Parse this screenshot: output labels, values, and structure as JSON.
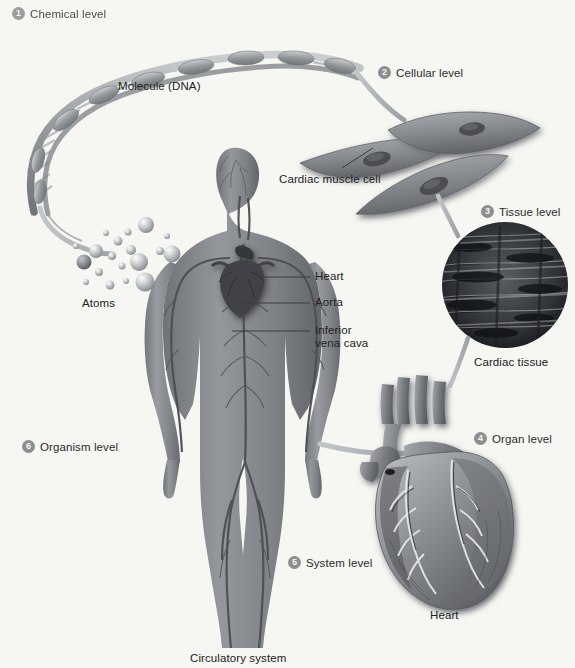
{
  "figure": {
    "background_color": "#f6f6f3",
    "badge_color": "#8e8e8e",
    "text_color": "#2b2b2b"
  },
  "levels": [
    {
      "number": "1",
      "label": "Chemical level",
      "x": 12,
      "y": 7
    },
    {
      "number": "2",
      "label": "Cellular level",
      "x": 378,
      "y": 66
    },
    {
      "number": "3",
      "label": "Tissue level",
      "x": 481,
      "y": 205
    },
    {
      "number": "4",
      "label": "Organ level",
      "x": 474,
      "y": 432
    },
    {
      "number": "5",
      "label": "System level",
      "x": 288,
      "y": 556
    },
    {
      "number": "6",
      "label": "Organism level",
      "x": 22,
      "y": 440
    }
  ],
  "captions": [
    {
      "name": "molecule-dna-caption",
      "text": "Molecule (DNA)",
      "x": 118,
      "y": 80
    },
    {
      "name": "atoms-caption",
      "text": "Atoms",
      "x": 82,
      "y": 297
    },
    {
      "name": "cardiac-muscle-cell-caption",
      "text": "Cardiac muscle cell",
      "x": 279,
      "y": 173
    },
    {
      "name": "cardiac-tissue-caption",
      "text": "Cardiac tissue",
      "x": 474,
      "y": 356
    },
    {
      "name": "heart-organ-caption",
      "text": "Heart",
      "x": 430,
      "y": 609
    },
    {
      "name": "circulatory-system-caption",
      "text": "Circulatory system",
      "x": 190,
      "y": 652
    }
  ],
  "body_labels": [
    {
      "name": "heart-label",
      "text": "Heart",
      "line2": "",
      "x": 315,
      "y": 276
    },
    {
      "name": "aorta-label",
      "text": "Aorta",
      "line2": "",
      "x": 315,
      "y": 302
    },
    {
      "name": "inferior-vena-cava-label",
      "text": "Inferior",
      "line2": "vena cava",
      "x": 315,
      "y": 325
    }
  ],
  "leader_lines": [
    {
      "name": "heart-leader",
      "x1": 261,
      "y1": 277,
      "x2": 310,
      "y2": 277
    },
    {
      "name": "aorta-leader",
      "x1": 238,
      "y1": 303,
      "x2": 310,
      "y2": 303
    },
    {
      "name": "inferior-vena-cava-leader",
      "x1": 232,
      "y1": 331,
      "x2": 310,
      "y2": 331
    },
    {
      "name": "cardiac-muscle-cell-leader",
      "x1": 342,
      "y1": 168,
      "x2": 373,
      "y2": 146
    }
  ],
  "connectors": [
    {
      "name": "dna-to-atoms-connector",
      "description": "tapered gray ribbon from DNA helix tail down to the atoms cluster"
    },
    {
      "name": "dna-to-cells-connector",
      "description": "tapered gray ribbon from DNA helix right end to the cardiac muscle cells"
    },
    {
      "name": "cells-to-tissue-connector",
      "description": "tapered gray ribbon from cardiac muscle cell down to the cardiac tissue micrograph"
    },
    {
      "name": "tissue-to-heart-connector",
      "description": "tapered gray ribbon from cardiac tissue circle down to the heart organ"
    },
    {
      "name": "body-to-heart-connector",
      "description": "tapered gray ribbon from the body's hand across to the heart organ"
    }
  ]
}
